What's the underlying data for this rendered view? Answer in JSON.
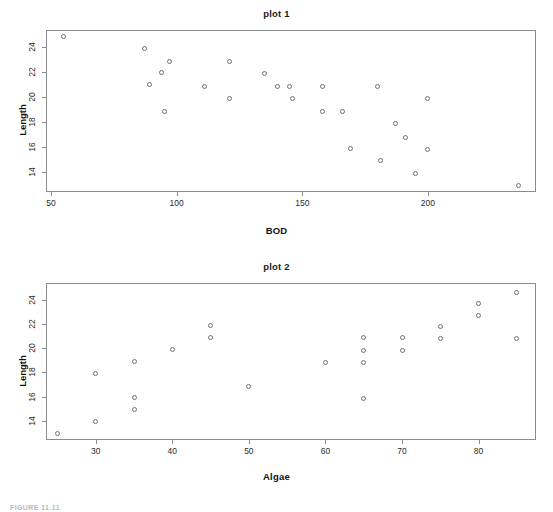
{
  "figure": {
    "caption": "FIGURE 11.11"
  },
  "chart_data": [
    {
      "type": "scatter",
      "title": "plot 1",
      "xlabel": "BOD",
      "ylabel": "Length",
      "xlim": [
        48,
        243
      ],
      "ylim": [
        12.4,
        25.4
      ],
      "xticks": [
        50,
        100,
        150,
        200
      ],
      "yticks": [
        14,
        16,
        18,
        20,
        22,
        24
      ],
      "grid": false,
      "legend": "none",
      "marker": "open-circle",
      "marker_color": "#6e6e78",
      "points": [
        {
          "x": 55,
          "y": 24.9
        },
        {
          "x": 87,
          "y": 23.9
        },
        {
          "x": 89,
          "y": 21.0
        },
        {
          "x": 94,
          "y": 22.0
        },
        {
          "x": 95,
          "y": 18.9
        },
        {
          "x": 97,
          "y": 22.9
        },
        {
          "x": 111,
          "y": 20.9
        },
        {
          "x": 121,
          "y": 22.9
        },
        {
          "x": 121,
          "y": 19.9
        },
        {
          "x": 135,
          "y": 21.9
        },
        {
          "x": 140,
          "y": 20.9
        },
        {
          "x": 145,
          "y": 20.9
        },
        {
          "x": 146,
          "y": 19.9
        },
        {
          "x": 158,
          "y": 20.9
        },
        {
          "x": 158,
          "y": 18.9
        },
        {
          "x": 166,
          "y": 18.9
        },
        {
          "x": 169,
          "y": 15.9
        },
        {
          "x": 180,
          "y": 20.9
        },
        {
          "x": 181,
          "y": 14.9
        },
        {
          "x": 187,
          "y": 17.9
        },
        {
          "x": 191,
          "y": 16.8
        },
        {
          "x": 195,
          "y": 13.9
        },
        {
          "x": 200,
          "y": 19.9
        },
        {
          "x": 200,
          "y": 15.8
        },
        {
          "x": 236,
          "y": 12.9
        }
      ]
    },
    {
      "type": "scatter",
      "title": "plot 2",
      "xlabel": "Algae",
      "ylabel": "Length",
      "xlim": [
        23.5,
        87.5
      ],
      "ylim": [
        12.4,
        25.4
      ],
      "xticks": [
        30,
        40,
        50,
        60,
        70,
        80
      ],
      "yticks": [
        14,
        16,
        18,
        20,
        22,
        24
      ],
      "grid": false,
      "legend": "none",
      "marker": "open-circle",
      "marker_color": "#6e6e78",
      "points": [
        {
          "x": 25,
          "y": 12.9
        },
        {
          "x": 30,
          "y": 17.9
        },
        {
          "x": 30,
          "y": 13.9
        },
        {
          "x": 35,
          "y": 18.9
        },
        {
          "x": 35,
          "y": 15.9
        },
        {
          "x": 35,
          "y": 14.9
        },
        {
          "x": 40,
          "y": 19.9
        },
        {
          "x": 45,
          "y": 21.9
        },
        {
          "x": 45,
          "y": 20.9
        },
        {
          "x": 50,
          "y": 16.8
        },
        {
          "x": 60,
          "y": 18.8
        },
        {
          "x": 65,
          "y": 20.9
        },
        {
          "x": 65,
          "y": 19.8
        },
        {
          "x": 65,
          "y": 18.8
        },
        {
          "x": 65,
          "y": 15.8
        },
        {
          "x": 70,
          "y": 20.9
        },
        {
          "x": 70,
          "y": 19.8
        },
        {
          "x": 75,
          "y": 21.8
        },
        {
          "x": 75,
          "y": 20.8
        },
        {
          "x": 80,
          "y": 23.7
        },
        {
          "x": 80,
          "y": 22.7
        },
        {
          "x": 85,
          "y": 24.6
        },
        {
          "x": 85,
          "y": 20.8
        }
      ]
    }
  ]
}
